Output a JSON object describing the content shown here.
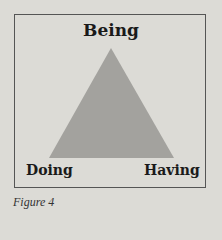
{
  "figure": {
    "caption": "Figure 4",
    "labels": {
      "top": "Being",
      "bottom_left": "Doing",
      "bottom_right": "Having"
    },
    "colors": {
      "background": "#dcdbd6",
      "triangle_fill": "#a3a29e",
      "border": "#555555",
      "text": "#1a1a1a"
    }
  }
}
